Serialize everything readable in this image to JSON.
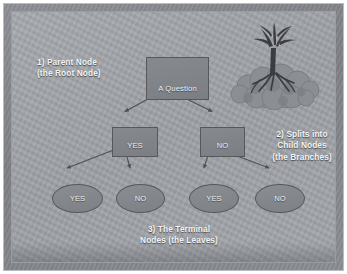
{
  "slide": {
    "title": "Decision Tree Anatomy Diagram",
    "colors": {
      "frame": "#83868b",
      "panel": "#a2a5aa",
      "node_fill": "#818489",
      "node_border": "#56585c",
      "text": "#f3f4f5",
      "edge": "#4e5054"
    }
  },
  "tree": {
    "root": {
      "label": "A Question"
    },
    "children": [
      {
        "label": "YES"
      },
      {
        "label": "NO"
      }
    ],
    "leaves": [
      {
        "label": "YES"
      },
      {
        "label": "NO"
      },
      {
        "label": "YES"
      },
      {
        "label": "NO"
      }
    ]
  },
  "captions": {
    "parent": "1) Parent Node\n(the Root Node)",
    "splits": "2) Splits into\nChild Nodes\n(the Branches)",
    "terminal": "3) The Terminal\nNodes (the Leaves)"
  },
  "illustration": {
    "name": "uprooted-tree-icon",
    "description": "Uprooted tree with exposed roots resting on a mound of foliage"
  }
}
